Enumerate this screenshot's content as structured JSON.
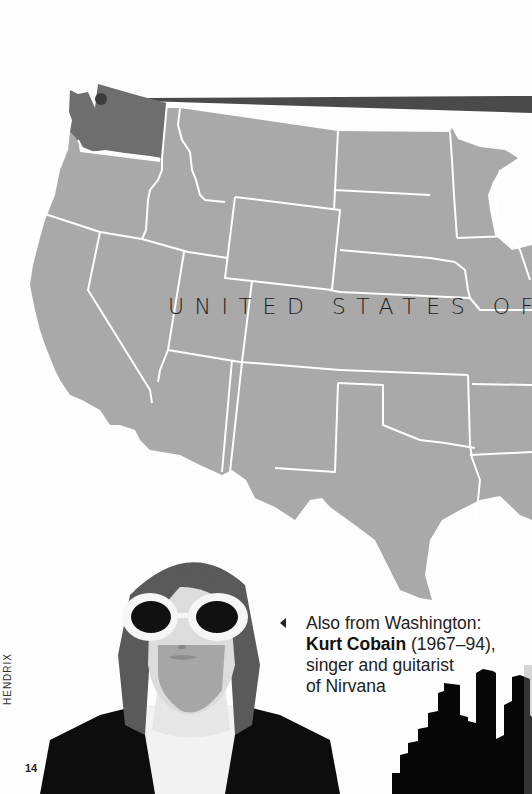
{
  "map": {
    "title": "UNITED STATES OF",
    "highlighted_state": "Washington",
    "colors": {
      "land": "#a9a9a9",
      "highlight": "#6e6e6e",
      "border": "#ffffff",
      "pointer": "#4a4a4a",
      "marker": "#3c3c3c"
    },
    "marker_icon": "location-dot-icon"
  },
  "caption": {
    "arrow_icon": "left-triangle-icon",
    "line1": "Also from Washington:",
    "name": "Kurt Cobain",
    "dates": " (1967–94),",
    "line3": "singer and guitarist",
    "line4": "of Nirvana"
  },
  "illustration": {
    "portrait_icon": "kurt-cobain-portrait-icon",
    "skyline_icon": "city-skyline-icon"
  },
  "footer": {
    "running_head": "HENDRIX",
    "page_number": "14"
  }
}
